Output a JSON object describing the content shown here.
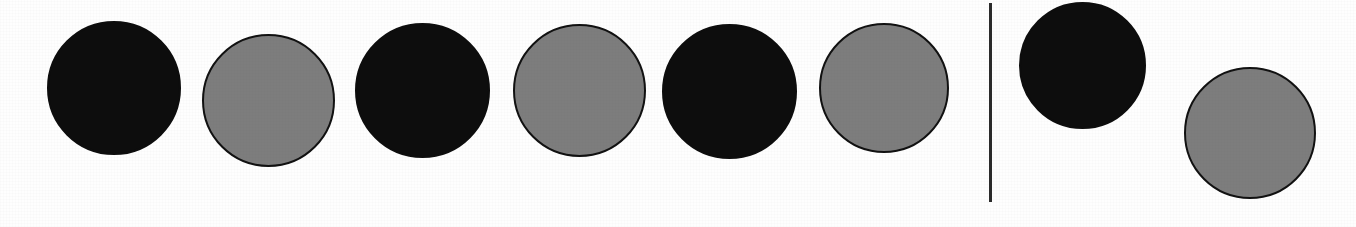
{
  "figure": {
    "kind": "counter-token-row",
    "background_color": "#fefefe",
    "width": 1356,
    "height": 227,
    "group_count": 2,
    "token_total": 8
  },
  "palette": {
    "filled_fill": "#0d0d0d",
    "filled_stroke": "#0d0d0d",
    "open_fill": "#7d7d7d",
    "open_stroke": "#111111",
    "divider_color": "#2a2a2a"
  },
  "divider": {
    "name": "group-divider",
    "x": 989,
    "y": 3,
    "width": 3,
    "height": 199
  },
  "groups": [
    {
      "name": "left-group",
      "label": "",
      "token_count": 6,
      "tokens": [
        {
          "index": 1,
          "shade": "filled",
          "label": "",
          "x": 47,
          "y": 21,
          "size": 134
        },
        {
          "index": 2,
          "shade": "open",
          "label": "",
          "x": 202,
          "y": 34,
          "size": 133
        },
        {
          "index": 3,
          "shade": "filled",
          "label": "",
          "x": 355,
          "y": 23,
          "size": 135
        },
        {
          "index": 4,
          "shade": "open",
          "label": "",
          "x": 513,
          "y": 24,
          "size": 133
        },
        {
          "index": 5,
          "shade": "filled",
          "label": "",
          "x": 662,
          "y": 24,
          "size": 135
        },
        {
          "index": 6,
          "shade": "open",
          "label": "",
          "x": 819,
          "y": 23,
          "size": 130
        }
      ]
    },
    {
      "name": "right-group",
      "label": "",
      "token_count": 2,
      "tokens": [
        {
          "index": 7,
          "shade": "filled",
          "label": "",
          "x": 1019,
          "y": 2,
          "size": 127
        },
        {
          "index": 8,
          "shade": "open",
          "label": "",
          "x": 1184,
          "y": 67,
          "size": 132
        }
      ]
    }
  ]
}
